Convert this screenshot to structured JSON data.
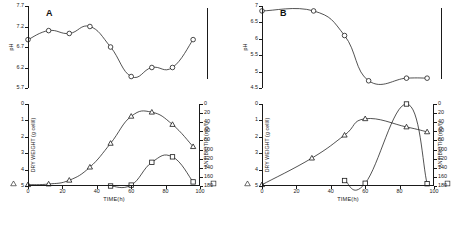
{
  "figure": {
    "panels": [
      {
        "letter": "A",
        "ph_chart": {
          "ylabel": "pH",
          "yticks": [
            "7.7",
            "7.2",
            "6.7",
            "6.2",
            "5.7"
          ],
          "ylim": [
            5.7,
            7.7
          ],
          "xlim": [
            0,
            100
          ],
          "series_name": "pH",
          "marker": "circle",
          "x": [
            0,
            12,
            24,
            36,
            48,
            60,
            72,
            84,
            96
          ],
          "y": [
            6.88,
            7.1,
            7.03,
            7.2,
            6.7,
            5.98,
            6.2,
            6.2,
            6.88
          ]
        },
        "growth_chart": {
          "ylabel": "DRY WEIGHT (g cell/l)",
          "ylabel_right": "ANTIBIOTIC (mg/l)",
          "xlabel": "TIME(h)",
          "yticks": [
            "0",
            "1",
            "2",
            "3",
            "4",
            "5"
          ],
          "ylim": [
            0,
            5
          ],
          "yticks_right": [
            "0",
            "20",
            "40",
            "60",
            "80",
            "100",
            "120",
            "140",
            "160",
            "180"
          ],
          "ylim_right": [
            0,
            180
          ],
          "xticks": [
            "0",
            "20",
            "40",
            "60",
            "80",
            "100"
          ],
          "xlim": [
            0,
            100
          ],
          "series": [
            {
              "name": "DRY WEIGHT",
              "marker": "triangle",
              "axis": "left",
              "x": [
                0,
                12,
                24,
                36,
                48,
                60,
                72,
                84,
                96
              ],
              "y": [
                0.08,
                0.12,
                0.35,
                1.15,
                2.6,
                4.25,
                4.5,
                3.75,
                2.4
              ]
            },
            {
              "name": "ANTIBIOTIC",
              "marker": "square",
              "axis": "right",
              "x": [
                48,
                60,
                72,
                84,
                96
              ],
              "y": [
                0,
                2,
                52,
                64,
                9
              ]
            }
          ]
        }
      },
      {
        "letter": "B",
        "ph_chart": {
          "ylabel": "pH",
          "yticks": [
            "7",
            "6.5",
            "6",
            "5.5",
            "5",
            "4.5"
          ],
          "ylim": [
            4.5,
            7.0
          ],
          "xlim": [
            0,
            100
          ],
          "series_name": "pH",
          "marker": "circle",
          "x": [
            0,
            30,
            48,
            62,
            84,
            96
          ],
          "y": [
            6.85,
            6.85,
            6.1,
            4.72,
            4.8,
            4.8
          ]
        },
        "growth_chart": {
          "ylabel": "DRY WEIGHT (g cell/l)",
          "ylabel_right": "ANTIBIOTIC (mg/l)",
          "xlabel": "TIME(h)",
          "yticks": [
            "0",
            "1",
            "2",
            "3",
            "4",
            "5"
          ],
          "ylim": [
            0,
            5
          ],
          "yticks_right": [
            "0",
            "20",
            "40",
            "60",
            "80",
            "100",
            "120",
            "140",
            "160",
            "180"
          ],
          "ylim_right": [
            0,
            180
          ],
          "xticks": [
            "0",
            "20",
            "40",
            "60",
            "80",
            "100"
          ],
          "xlim": [
            0,
            100
          ],
          "series": [
            {
              "name": "DRY WEIGHT",
              "marker": "triangle",
              "axis": "left",
              "x": [
                0,
                29,
                48,
                60,
                84,
                96
              ],
              "y": [
                0.08,
                1.7,
                3.1,
                4.1,
                3.6,
                3.3
              ]
            },
            {
              "name": "ANTIBIOTIC",
              "marker": "square",
              "axis": "right",
              "x": [
                48,
                60,
                84,
                96
              ],
              "y": [
                12,
                6,
                180,
                5
              ]
            }
          ]
        }
      }
    ],
    "legend_markers": [
      "triangle",
      "square"
    ]
  },
  "chart_data": [
    {
      "type": "line",
      "title": "A - pH profile",
      "xlabel": "TIME(h)",
      "ylabel": "pH",
      "xlim": [
        0,
        100
      ],
      "ylim": [
        5.7,
        7.7
      ],
      "grid": false,
      "x": [
        0,
        12,
        24,
        36,
        48,
        60,
        72,
        84,
        96
      ],
      "series": [
        {
          "name": "pH",
          "marker": "open-circle",
          "values": [
            6.88,
            7.1,
            7.03,
            7.2,
            6.7,
            5.98,
            6.2,
            6.2,
            6.88
          ]
        }
      ]
    },
    {
      "type": "line",
      "title": "A - growth and antibiotic production",
      "xlabel": "TIME(h)",
      "ylabel": "DRY WEIGHT (g cell/l)",
      "ylabel_right": "ANTIBIOTIC (mg/l)",
      "xlim": [
        0,
        100
      ],
      "ylim": [
        0,
        5
      ],
      "ylim_right": [
        0,
        180
      ],
      "grid": false,
      "series": [
        {
          "name": "DRY WEIGHT",
          "marker": "open-triangle",
          "axis": "left",
          "x": [
            0,
            12,
            24,
            36,
            48,
            60,
            72,
            84,
            96
          ],
          "values": [
            0.08,
            0.12,
            0.35,
            1.15,
            2.6,
            4.25,
            4.5,
            3.75,
            2.4
          ]
        },
        {
          "name": "ANTIBIOTIC",
          "marker": "open-square",
          "axis": "right",
          "x": [
            48,
            60,
            72,
            84,
            96
          ],
          "values": [
            0,
            2,
            52,
            64,
            9
          ]
        }
      ]
    },
    {
      "type": "line",
      "title": "B - pH profile",
      "xlabel": "TIME(h)",
      "ylabel": "pH",
      "xlim": [
        0,
        100
      ],
      "ylim": [
        4.5,
        7.0
      ],
      "grid": false,
      "x": [
        0,
        30,
        48,
        62,
        84,
        96
      ],
      "series": [
        {
          "name": "pH",
          "marker": "open-circle",
          "values": [
            6.85,
            6.85,
            6.1,
            4.72,
            4.8,
            4.8
          ]
        }
      ]
    },
    {
      "type": "line",
      "title": "B - growth and antibiotic production",
      "xlabel": "TIME(h)",
      "ylabel": "DRY WEIGHT (g cell/l)",
      "ylabel_right": "ANTIBIOTIC (mg/l)",
      "xlim": [
        0,
        100
      ],
      "ylim": [
        0,
        5
      ],
      "ylim_right": [
        0,
        180
      ],
      "grid": false,
      "series": [
        {
          "name": "DRY WEIGHT",
          "marker": "open-triangle",
          "axis": "left",
          "x": [
            0,
            29,
            48,
            60,
            84,
            96
          ],
          "values": [
            0.08,
            1.7,
            3.1,
            4.1,
            3.6,
            3.3
          ]
        },
        {
          "name": "ANTIBIOTIC",
          "marker": "open-square",
          "axis": "right",
          "x": [
            48,
            60,
            84,
            96
          ],
          "values": [
            12,
            6,
            180,
            5
          ]
        }
      ]
    }
  ]
}
